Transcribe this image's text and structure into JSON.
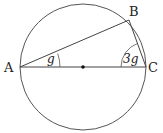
{
  "diagram": {
    "type": "circle-geometry",
    "circle": {
      "cx": 83,
      "cy": 67,
      "r": 63
    },
    "points": {
      "A": {
        "label": "A",
        "x": 20,
        "y": 67
      },
      "B": {
        "label": "B",
        "x": 129,
        "y": 20
      },
      "C": {
        "label": "C",
        "x": 146,
        "y": 67
      },
      "O": {
        "label": "",
        "x": 83,
        "y": 67
      }
    },
    "angles": {
      "at_A": {
        "label": "g"
      },
      "at_C": {
        "label": "3g"
      }
    },
    "colors": {
      "stroke": "#444444",
      "text": "#222222"
    }
  }
}
